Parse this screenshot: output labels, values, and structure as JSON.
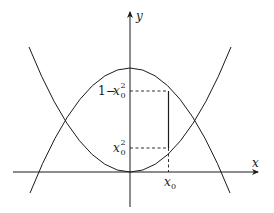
{
  "diagram": {
    "axes": {
      "x_label": "x",
      "y_label": "y"
    },
    "curves": [
      {
        "name": "upper-parabola",
        "equation": "y = 1 - x^2"
      },
      {
        "name": "lower-parabola",
        "equation": "y = x^2"
      }
    ],
    "labels": {
      "x0": "x",
      "x0_sub": "0",
      "y_top_prefix": "1−",
      "y_top_var": "x",
      "y_top_sup": "2",
      "y_top_sub": "0",
      "y_bottom_var": "x",
      "y_bottom_sup": "2",
      "y_bottom_sub": "0"
    },
    "colors": {
      "stroke": "#1a1a1a",
      "background": "#ffffff"
    }
  }
}
